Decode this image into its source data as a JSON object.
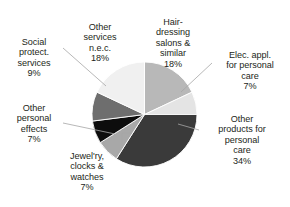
{
  "chart_data": {
    "type": "pie",
    "title": "",
    "subtitle": "",
    "xlabel": "",
    "ylabel": "",
    "legend_position": "none",
    "grid": false,
    "labels_show_percent": true,
    "start_angle_deg": 0,
    "direction": "clockwise",
    "categories": [
      "Hair-dressing salons & similar",
      "Elec. appl. for personal care",
      "Other products for personal care",
      "Jewel'ry, clocks & watches",
      "Other personal effects",
      "Social protect. services",
      "Other services n.e.c."
    ],
    "values": [
      18,
      7,
      34,
      7,
      7,
      9,
      18
    ],
    "value_labels": [
      "18%",
      "7%",
      "34%",
      "7%",
      "7%",
      "9%",
      "18%"
    ],
    "colors": [
      "#b8b8b8",
      "#e4e4e4",
      "#3a3a3a",
      "#a8a8a8",
      "#0d0d0d",
      "#6e6e6e",
      "#f0f0f0"
    ],
    "slices": [
      {
        "name": "hair-dressing",
        "label": "Hair-\ndressing\nsalons &\nsimilar",
        "percent_text": "18%",
        "value": 18,
        "color": "#b8b8b8"
      },
      {
        "name": "elec-appliances",
        "label": "Elec. appl.\nfor personal\ncare",
        "percent_text": "7%",
        "value": 7,
        "color": "#e4e4e4"
      },
      {
        "name": "other-products",
        "label": "Other\nproducts for\npersonal\ncare",
        "percent_text": "34%",
        "value": 34,
        "color": "#3a3a3a"
      },
      {
        "name": "jewellery-clocks-watches",
        "label": "Jewel'ry,\nclocks &\nwatches",
        "percent_text": "7%",
        "value": 7,
        "color": "#a8a8a8"
      },
      {
        "name": "other-personal-effects",
        "label": "Other\npersonal\neffects",
        "percent_text": "7%",
        "value": 7,
        "color": "#0d0d0d"
      },
      {
        "name": "social-protection-services",
        "label": "Social\nprotect.\nservices",
        "percent_text": "9%",
        "value": 9,
        "color": "#6e6e6e"
      },
      {
        "name": "other-services-nec",
        "label": "Other\nservices\nn.e.c.",
        "percent_text": "18%",
        "value": 18,
        "color": "#f0f0f0"
      }
    ]
  },
  "style": {
    "background": "#ffffff",
    "text_color": "#231f20",
    "leader_line_color": "#a6a6a6",
    "slice_border_color": "#ffffff"
  }
}
